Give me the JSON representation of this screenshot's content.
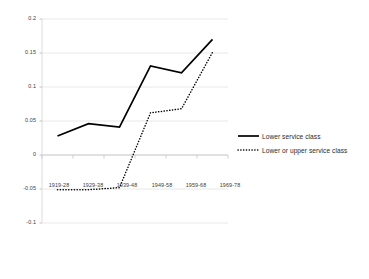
{
  "chart_data": {
    "type": "line",
    "title": "",
    "xlabel": "",
    "ylabel": "",
    "categories": [
      "1919-28",
      "1929-38",
      "1939-48",
      "1949-58",
      "1959-68",
      "1969-78"
    ],
    "series": [
      {
        "name": "Lower service class",
        "style": "solid",
        "color": "#000000",
        "values": [
          0.028,
          0.046,
          0.041,
          0.131,
          0.121,
          0.17
        ]
      },
      {
        "name": "Lower or upper service class",
        "style": "dotted",
        "color": "#000000",
        "values": [
          -0.051,
          -0.051,
          -0.048,
          0.062,
          0.068,
          0.151
        ]
      }
    ],
    "ylim": [
      -0.1,
      0.2
    ],
    "yticks": [
      "0.2",
      "0.15",
      "0.1",
      "0.05",
      "0",
      "-0.05",
      "-0.1"
    ],
    "ytick_values": [
      0.2,
      0.15,
      0.1,
      0.05,
      0,
      -0.05,
      -0.1
    ],
    "grid": true,
    "grid_axis": "y",
    "legend_position": "right"
  },
  "legend": {
    "items": [
      {
        "label": "Lower service class"
      },
      {
        "label": "Lower or upper service class"
      }
    ]
  }
}
